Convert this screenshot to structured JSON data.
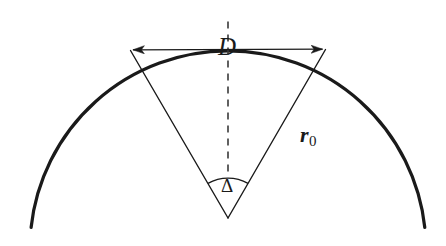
{
  "figure": {
    "background_color": "#ffffff",
    "stroke_color": "#1a1a1a",
    "labels": {
      "chord": "D",
      "radius_symbol": "r",
      "radius_subscript": "0",
      "angle": "Δ"
    },
    "geometry": {
      "center_x": 228,
      "center_y": 218,
      "sphere_radius": 198,
      "arc_top_y": 20,
      "arc_left_x": 31,
      "arc_right_x": 421,
      "chord_left_x": 130,
      "chord_left_y": 50,
      "chord_right_x": 325,
      "chord_right_y": 49,
      "angle_arc_radius": 40,
      "half_angle_degrees": 30,
      "arc_stroke_width": 3.2,
      "ray_stroke_width": 1.4,
      "dash_pattern": "7 6"
    }
  }
}
